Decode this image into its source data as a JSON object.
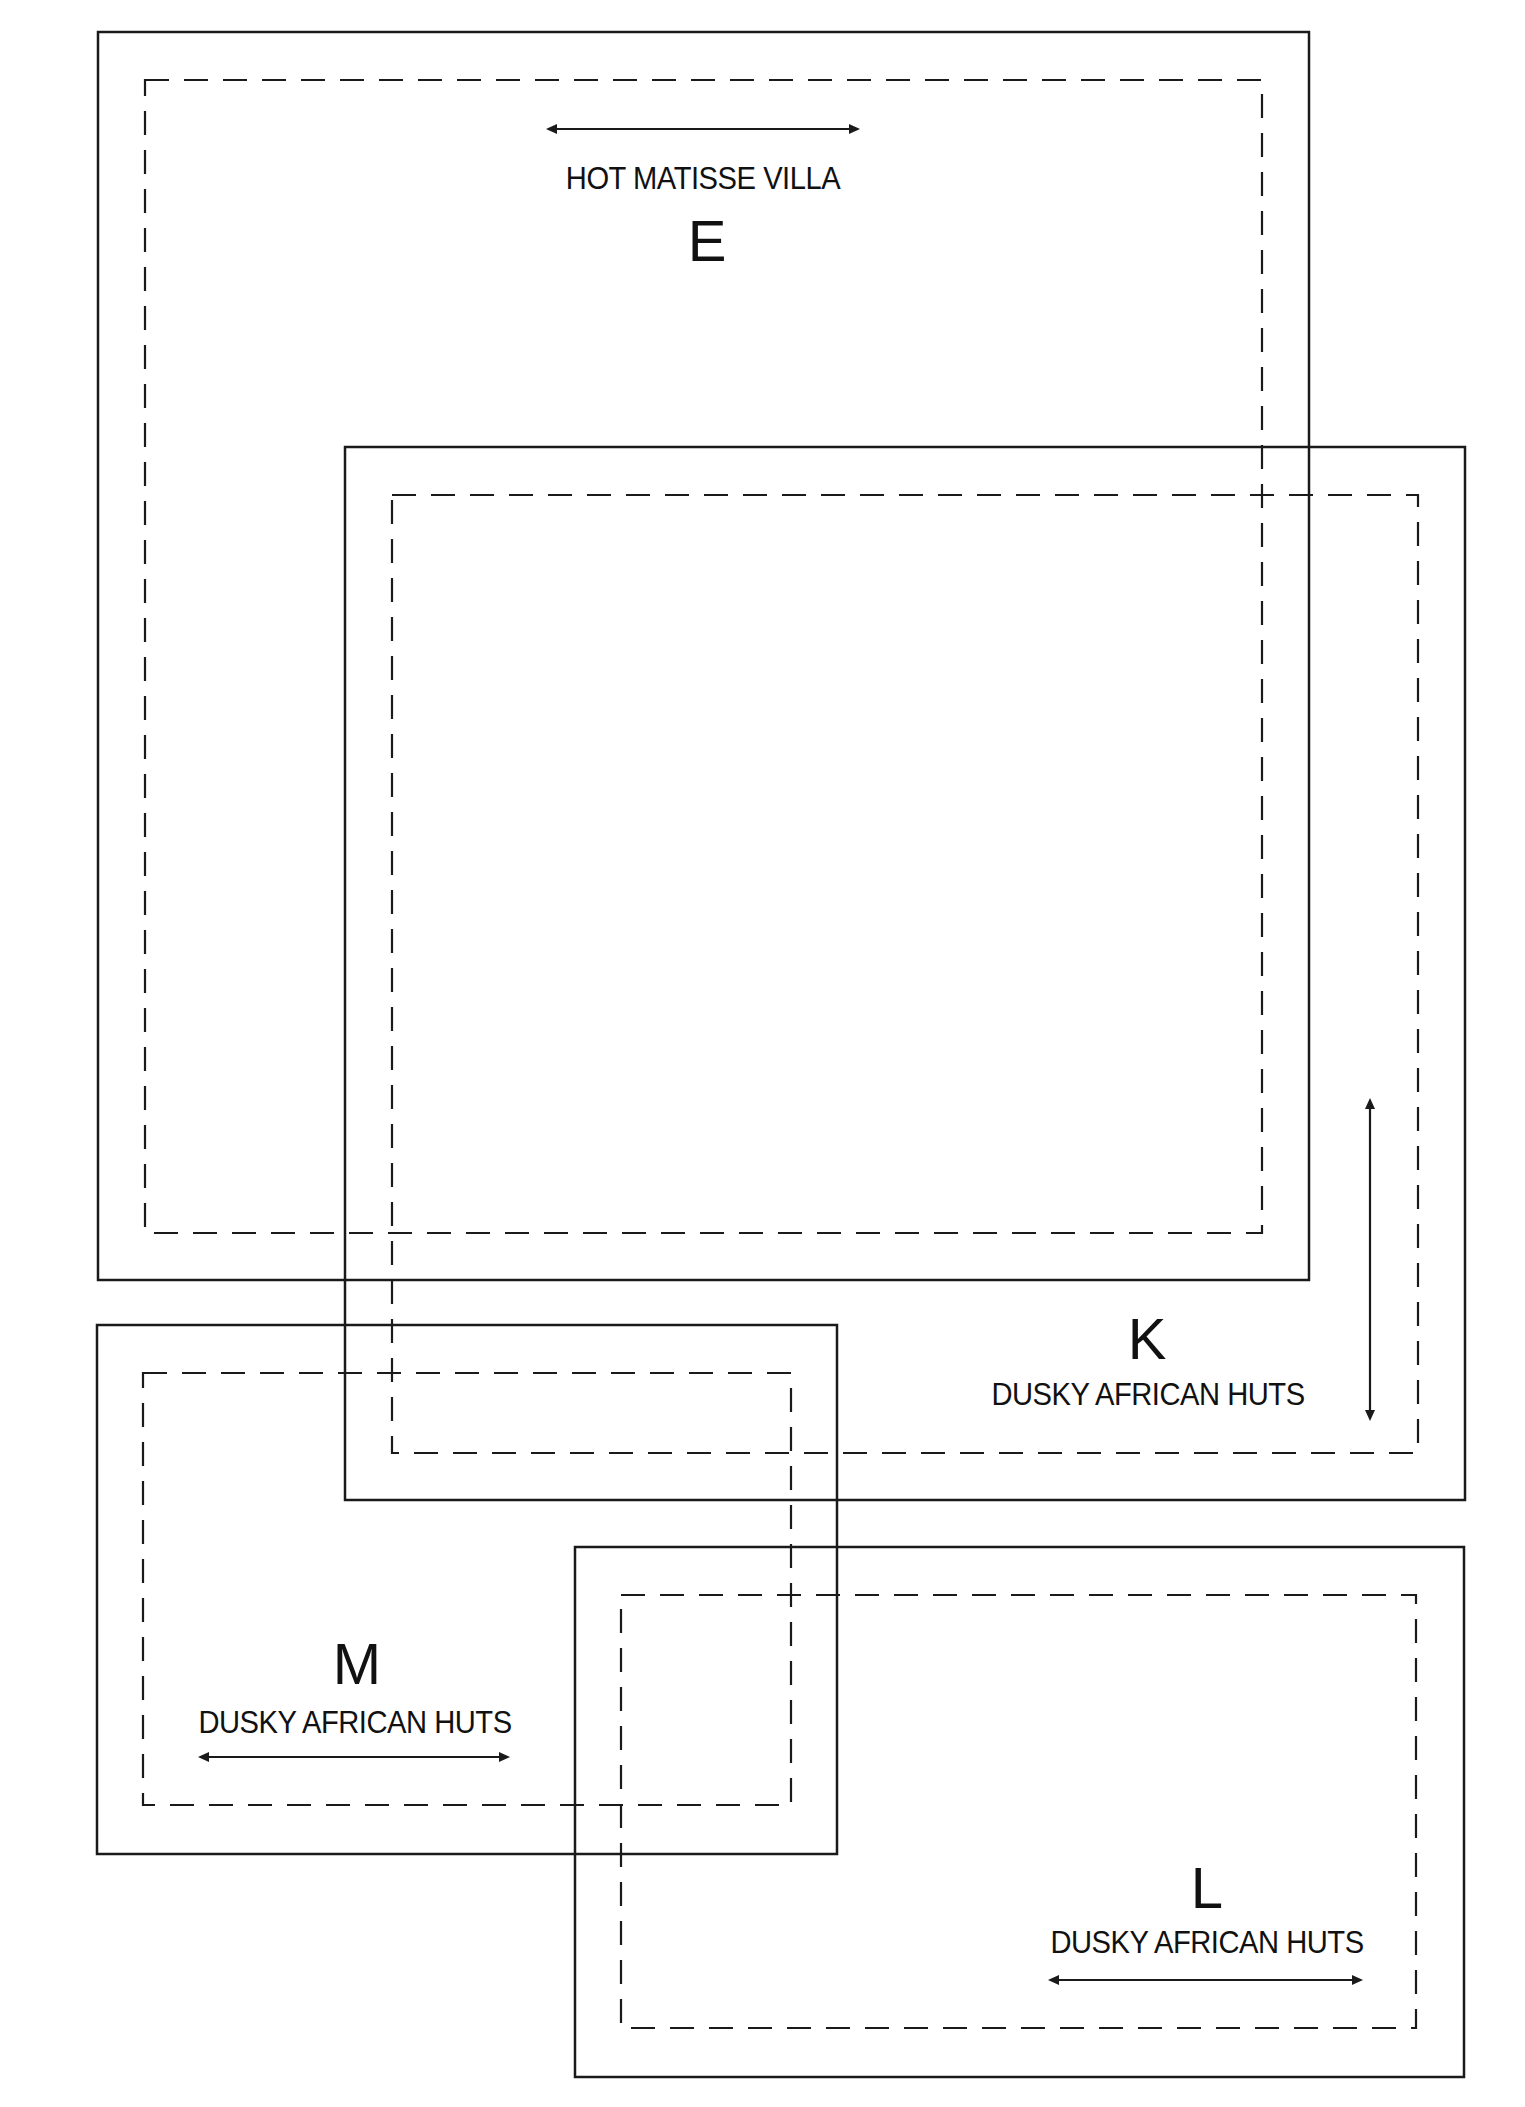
{
  "diagram": {
    "type": "overlapping-layout-plan",
    "colors": {
      "line": "#1a1a1a",
      "background": "#ffffff"
    },
    "regions": [
      {
        "id": "E",
        "letter": "E",
        "caption": "HOT MATISSE VILLA",
        "outer": {
          "x": 98,
          "y": 32,
          "w": 1211,
          "h": 1248
        },
        "inner": {
          "x": 145,
          "y": 80,
          "w": 1117,
          "h": 1153
        },
        "arrow": {
          "orientation": "horizontal",
          "x1": 546,
          "y1": 129,
          "x2": 860,
          "y2": 129
        }
      },
      {
        "id": "K",
        "letter": "K",
        "caption": "DUSKY AFRICAN HUTS",
        "outer": {
          "x": 345,
          "y": 447,
          "w": 1120,
          "h": 1053
        },
        "inner": {
          "x": 392,
          "y": 495,
          "w": 1026,
          "h": 958
        },
        "arrow": {
          "orientation": "vertical",
          "x1": 1370,
          "y1": 1098,
          "x2": 1370,
          "y2": 1421
        }
      },
      {
        "id": "M",
        "letter": "M",
        "caption": "DUSKY AFRICAN HUTS",
        "outer": {
          "x": 97,
          "y": 1325,
          "w": 740,
          "h": 529
        },
        "inner": {
          "x": 143,
          "y": 1373,
          "w": 648,
          "h": 432
        },
        "arrow": {
          "orientation": "horizontal",
          "x1": 198,
          "y1": 1757,
          "x2": 510,
          "y2": 1757
        }
      },
      {
        "id": "L",
        "letter": "L",
        "caption": "DUSKY AFRICAN HUTS",
        "outer": {
          "x": 575,
          "y": 1547,
          "w": 889,
          "h": 530
        },
        "inner": {
          "x": 621,
          "y": 1595,
          "w": 795,
          "h": 433
        },
        "arrow": {
          "orientation": "horizontal",
          "x1": 1048,
          "y1": 1980,
          "x2": 1363,
          "y2": 1980
        }
      }
    ]
  },
  "labels": {
    "E": {
      "letter": "E",
      "caption": "HOT MATISSE VILLA"
    },
    "K": {
      "letter": "K",
      "caption": "DUSKY AFRICAN HUTS"
    },
    "M": {
      "letter": "M",
      "caption": "DUSKY AFRICAN HUTS"
    },
    "L": {
      "letter": "L",
      "caption": "DUSKY AFRICAN HUTS"
    }
  }
}
